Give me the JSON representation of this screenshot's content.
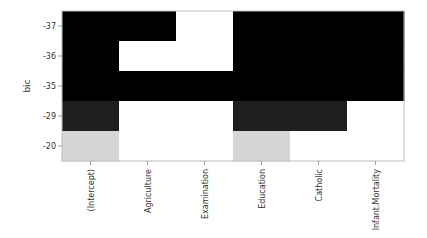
{
  "chart_data": {
    "type": "heatmap",
    "title": "",
    "xlabel": "",
    "ylabel": "bic",
    "columns": [
      "(Intercept)",
      "Agriculture",
      "Examination",
      "Education",
      "Catholic",
      "Infant.Mortality"
    ],
    "rows": [
      "-37",
      "-36",
      "-35",
      "-29",
      "-20"
    ],
    "row_fill_order": "top-to-bottom",
    "grid": false,
    "colors": {
      "-37": "#000000",
      "-36": "#000000",
      "-35": "#000000",
      "-29": "#1e1e1e",
      "-20": "#d6d6d6",
      "none": "#ffffff"
    },
    "cells": [
      [
        1,
        1,
        0,
        1,
        1,
        1
      ],
      [
        1,
        0,
        0,
        1,
        1,
        1
      ],
      [
        1,
        1,
        1,
        1,
        1,
        1
      ],
      [
        1,
        0,
        0,
        1,
        1,
        0
      ],
      [
        1,
        0,
        0,
        1,
        0,
        0
      ]
    ]
  }
}
